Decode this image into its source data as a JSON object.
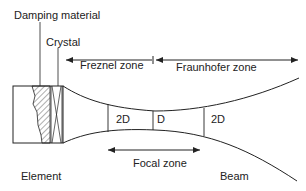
{
  "diagram": {
    "labels": {
      "damping_material": "Damping material",
      "crystal": "Crystal",
      "freznel_zone": "Freznel zone",
      "fraunhofer_zone": "Fraunhofer zone",
      "focal_zone": "Focal zone",
      "element": "Element",
      "beam": "Beam",
      "width_left": "2D",
      "width_focus": "D",
      "width_right": "2D"
    },
    "colors": {
      "line": "#222222",
      "background": "#ffffff"
    }
  }
}
